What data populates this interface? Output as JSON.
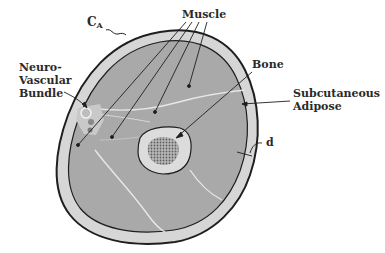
{
  "diagram": {
    "type": "anatomical cross-section",
    "labels": {
      "ca_main": "C",
      "ca_sub": "A",
      "muscle": "Muscle",
      "bone": "Bone",
      "neurovascular": "Neuro-\nVascular\nBundle",
      "subcutaneous": "Subcutaneous\nAdipose",
      "d": "d"
    },
    "colors": {
      "outline": "#1e1e1e",
      "adipose": "#d6d6d6",
      "muscle": "#a9a9a9",
      "fascia": "#e8e8e8",
      "bone_cortex": "#dcdcdc",
      "marrow": "#8c8c8c",
      "text": "#2a2a2a"
    }
  }
}
